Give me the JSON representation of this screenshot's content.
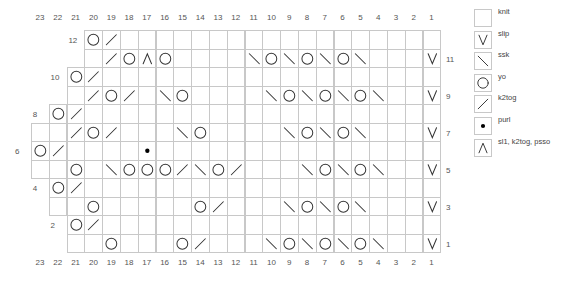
{
  "chart_data": {
    "type": "table",
    "columns": 23,
    "rows": 12,
    "column_labels_top": [
      "23",
      "22",
      "21",
      "20",
      "19",
      "18",
      "17",
      "16",
      "15",
      "14",
      "13",
      "12",
      "11",
      "10",
      "9",
      "8",
      "7",
      "6",
      "5",
      "4",
      "3",
      "2",
      "1"
    ],
    "column_labels_bottom": [
      "23",
      "22",
      "21",
      "20",
      "19",
      "18",
      "17",
      "16",
      "15",
      "14",
      "13",
      "12",
      "11",
      "10",
      "9",
      "8",
      "7",
      "6",
      "5",
      "4",
      "3",
      "2",
      "1"
    ],
    "right_row_labels": [
      "11",
      "9",
      "7",
      "5",
      "3",
      "1"
    ],
    "left_row_labels": [
      "12",
      "10",
      "8",
      "6",
      "4",
      "2"
    ],
    "grid": [
      {
        "row": 12,
        "start_col": 20,
        "stitches": {
          "20": "yo",
          "19": "k2tog"
        }
      },
      {
        "row": 11,
        "start_col": 20,
        "stitches": {
          "19": "k2tog",
          "18": "yo",
          "17": "sl1-k2tog-psso",
          "16": "yo",
          "11": "ssk",
          "10": "yo",
          "9": "ssk",
          "8": "yo",
          "7": "ssk",
          "6": "yo",
          "5": "ssk",
          "1": "slip"
        }
      },
      {
        "row": 10,
        "start_col": 21,
        "stitches": {
          "21": "yo",
          "20": "k2tog"
        }
      },
      {
        "row": 9,
        "start_col": 21,
        "stitches": {
          "20": "k2tog",
          "19": "yo",
          "18": "k2tog",
          "16": "ssk",
          "15": "yo",
          "10": "ssk",
          "9": "yo",
          "8": "ssk",
          "7": "yo",
          "6": "ssk",
          "5": "yo",
          "4": "ssk",
          "1": "slip"
        }
      },
      {
        "row": 8,
        "start_col": 22,
        "stitches": {
          "22": "yo",
          "21": "k2tog"
        }
      },
      {
        "row": 7,
        "start_col": 23,
        "stitches": {
          "21": "k2tog",
          "20": "yo",
          "19": "k2tog",
          "15": "ssk",
          "14": "yo",
          "9": "ssk",
          "8": "yo",
          "7": "ssk",
          "6": "yo",
          "5": "ssk",
          "1": "slip"
        }
      },
      {
        "row": 6,
        "start_col": 23,
        "stitches": {
          "23": "yo",
          "22": "k2tog",
          "17": "purl"
        }
      },
      {
        "row": 5,
        "start_col": 23,
        "stitches": {
          "21": "yo",
          "19": "ssk",
          "18": "yo",
          "17": "yo",
          "16": "yo",
          "15": "k2tog",
          "14": "ssk",
          "13": "yo",
          "12": "k2tog",
          "8": "ssk",
          "7": "yo",
          "6": "ssk",
          "5": "yo",
          "4": "ssk",
          "1": "slip"
        }
      },
      {
        "row": 4,
        "start_col": 22,
        "stitches": {
          "22": "yo",
          "21": "k2tog"
        }
      },
      {
        "row": 3,
        "start_col": 22,
        "stitches": {
          "20": "yo",
          "14": "yo",
          "13": "k2tog",
          "9": "ssk",
          "8": "yo",
          "7": "ssk",
          "6": "yo",
          "5": "ssk",
          "1": "slip"
        }
      },
      {
        "row": 2,
        "start_col": 21,
        "stitches": {
          "21": "yo",
          "20": "k2tog"
        }
      },
      {
        "row": 1,
        "start_col": 21,
        "stitches": {
          "19": "yo",
          "15": "yo",
          "14": "k2tog",
          "10": "ssk",
          "9": "yo",
          "8": "ssk",
          "7": "yo",
          "6": "ssk",
          "5": "yo",
          "4": "ssk",
          "1": "slip"
        }
      }
    ],
    "legend": [
      {
        "symbol": "knit",
        "label": "knit"
      },
      {
        "symbol": "slip",
        "label": "slip"
      },
      {
        "symbol": "ssk",
        "label": "ssk"
      },
      {
        "symbol": "yo",
        "label": "yo"
      },
      {
        "symbol": "k2tog",
        "label": "k2tog"
      },
      {
        "symbol": "purl",
        "label": "purl"
      },
      {
        "symbol": "sl1-k2tog-psso",
        "label": "sl1, k2tog, psso"
      }
    ]
  },
  "colors": {
    "grid": "#c8c8c8",
    "symbol": "#333333",
    "label": "#555555"
  }
}
